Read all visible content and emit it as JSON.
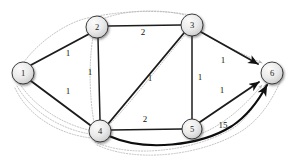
{
  "figure": {
    "type": "weighted-directed-graph-diagram",
    "background_color": "#ffffff",
    "node_fill_color": "#e6e6e6",
    "node_stroke_color": "#2b2b2b",
    "edge_color": "#1c1c1c",
    "dotted_path_color": "#b4b4b4"
  },
  "nodes": [
    {
      "id": "1",
      "label": "1",
      "cx": 23,
      "cy": 73,
      "r": 11
    },
    {
      "id": "2",
      "label": "2",
      "cx": 97,
      "cy": 27,
      "r": 11
    },
    {
      "id": "3",
      "label": "3",
      "cx": 192,
      "cy": 25,
      "r": 11
    },
    {
      "id": "4",
      "label": "4",
      "cx": 100,
      "cy": 131,
      "r": 11
    },
    {
      "id": "5",
      "label": "5",
      "cx": 192,
      "cy": 129,
      "r": 10
    },
    {
      "id": "6",
      "label": "6",
      "cx": 272,
      "cy": 73,
      "r": 11
    }
  ],
  "edges": [
    {
      "id": "e1-2",
      "from": "1",
      "to": "2",
      "weight": "1",
      "weight_x": 68,
      "weight_y": 53
    },
    {
      "id": "e1-4",
      "from": "1",
      "to": "4",
      "weight": "1",
      "weight_x": 68,
      "weight_y": 91
    },
    {
      "id": "e2-3",
      "from": "2",
      "to": "3",
      "weight": "2",
      "weight_x": 143,
      "weight_y": 32
    },
    {
      "id": "e2-4",
      "from": "2",
      "to": "4",
      "weight": "1",
      "weight_x": 90,
      "weight_y": 72
    },
    {
      "id": "e3-4",
      "from": "3",
      "to": "4",
      "weight": "1",
      "weight_x": 150,
      "weight_y": 78
    },
    {
      "id": "e3-5",
      "from": "3",
      "to": "5",
      "weight": "1",
      "weight_x": 200,
      "weight_y": 77
    },
    {
      "id": "e3-6",
      "from": "3",
      "to": "6",
      "weight": "1",
      "weight_x": 223,
      "weight_y": 60
    },
    {
      "id": "e4-5",
      "from": "4",
      "to": "5",
      "weight": "2",
      "weight_x": 145,
      "weight_y": 119
    },
    {
      "id": "e5-6",
      "from": "5",
      "to": "6",
      "weight": "1",
      "weight_x": 222,
      "weight_y": 90
    },
    {
      "id": "e4-6",
      "from": "4",
      "to": "6",
      "weight": "15",
      "weight_x": 222,
      "weight_y": 125
    }
  ],
  "arrow_targets": [
    {
      "id": "arrow-into-6-from-3",
      "to": "6"
    },
    {
      "id": "arrow-into-6-from-5",
      "to": "6"
    },
    {
      "id": "arrow-into-6-from-4",
      "to": "6"
    }
  ]
}
